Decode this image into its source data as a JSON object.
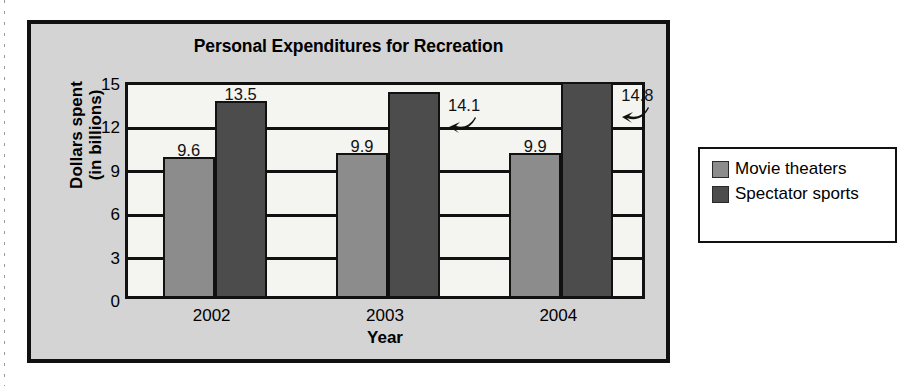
{
  "chart_data": {
    "type": "bar",
    "title": "Personal Expenditures for Recreation",
    "xlabel": "Year",
    "ylabel": "Dollars spent (in billions)",
    "ylabel_line1": "Dollars spent",
    "ylabel_line2": "(in billions)",
    "categories": [
      "2002",
      "2003",
      "2004"
    ],
    "ylim": [
      0,
      15
    ],
    "yticks": [
      "0",
      "3",
      "6",
      "9",
      "12",
      "15"
    ],
    "ytick_values": [
      0,
      3,
      6,
      9,
      12,
      15
    ],
    "grid": true,
    "legend_position": "right-outside",
    "series": [
      {
        "name": "Movie theaters",
        "color": "#8c8c8c",
        "values": [
          9.6,
          9.9,
          9.9
        ],
        "labels": [
          "9.6",
          "9.9",
          "9.9"
        ]
      },
      {
        "name": "Spectator sports",
        "color": "#4c4c4c",
        "values": [
          13.5,
          14.1,
          14.8
        ],
        "labels": [
          "13.5",
          "14.1",
          "14.8"
        ]
      }
    ],
    "annotations": [
      {
        "text": "14.1",
        "icon": "curved-left-arrow-icon",
        "points_to": "2003 Spectator sports bar"
      },
      {
        "text": "14.8",
        "icon": "curved-left-arrow-icon",
        "points_to": "2004 Spectator sports bar"
      }
    ]
  },
  "colors": {
    "movie_theaters": "#8c8c8c",
    "spectator_sports": "#4c4c4c",
    "chart_background": "#d4d4d4",
    "plot_background": "#f4f4f0",
    "frame": "#111111"
  }
}
